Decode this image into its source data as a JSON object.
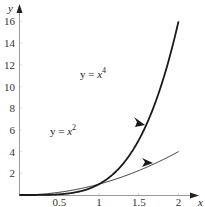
{
  "chart_data": {
    "type": "line",
    "title": "",
    "xlabel": "x",
    "ylabel": "y",
    "xlim": [
      0,
      2.1
    ],
    "ylim": [
      0,
      16.5
    ],
    "grid": false,
    "legend": null,
    "x_ticks": [
      0.5,
      1,
      1.5,
      2
    ],
    "x_tick_labels": [
      "0.5",
      "1",
      "1.5",
      "2"
    ],
    "y_ticks": [
      2,
      4,
      6,
      8,
      10,
      12,
      14,
      16
    ],
    "y_tick_labels": [
      "2",
      "4",
      "6",
      "8",
      "10",
      "12",
      "14",
      "16"
    ],
    "series": [
      {
        "name": "y = x^4",
        "function": "x^4",
        "x": [
          0,
          0.25,
          0.5,
          0.75,
          1,
          1.25,
          1.5,
          1.75,
          2
        ],
        "values": [
          0,
          0.0039,
          0.0625,
          0.3164,
          1,
          2.4414,
          5.0625,
          9.3789,
          16
        ],
        "line_width": "thick",
        "color": "#1a1a1a"
      },
      {
        "name": "y = x^2",
        "function": "x^2",
        "x": [
          0,
          0.25,
          0.5,
          0.75,
          1,
          1.25,
          1.5,
          1.75,
          2
        ],
        "values": [
          0,
          0.0625,
          0.25,
          0.5625,
          1,
          1.5625,
          2.25,
          3.0625,
          4
        ],
        "line_width": "thin",
        "color": "#1a1a1a"
      }
    ],
    "annotations": [
      {
        "text_base": "y = x",
        "exponent": "4",
        "points_to": "y = x^4",
        "arrow_at": [
          1.5,
          6.8
        ]
      },
      {
        "text_base": "y = x",
        "exponent": "2",
        "points_to": "y = x^2",
        "arrow_at": [
          1.62,
          3.0
        ]
      }
    ],
    "intersection": {
      "x": 1,
      "y": 1
    }
  },
  "labels": {
    "x_axis": "x",
    "y_axis": "y",
    "eq_quartic": {
      "lhs": "y = ",
      "var": "x",
      "exp": "4"
    },
    "eq_square": {
      "lhs": "y = ",
      "var": "x",
      "exp": "2"
    }
  },
  "colors": {
    "axis": "#9a9a9a",
    "curve": "#1a1a1a",
    "text": "#333333"
  }
}
